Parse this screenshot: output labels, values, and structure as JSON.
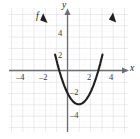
{
  "figure": {
    "kind": "cartesian-graph",
    "background": "#ffffff",
    "grid_color": "#d9d9de",
    "axis_color": "#6d6e71",
    "curve_color": "#231f20",
    "tick_text_color": "#3a3a3c"
  },
  "axes": {
    "x_axis_label": "x",
    "y_axis_label": "y",
    "x_ticks": [
      {
        "label": "–4",
        "value": -4
      },
      {
        "label": "–2",
        "value": -2
      },
      {
        "label": "2",
        "value": 2
      },
      {
        "label": "4",
        "value": 4
      }
    ],
    "y_ticks": [
      {
        "label": "4",
        "value": 4
      },
      {
        "label": "2",
        "value": 2
      },
      {
        "label": "–2",
        "value": -2
      },
      {
        "label": "–4",
        "value": -4
      }
    ],
    "xlim": [
      -5,
      5.5
    ],
    "ylim": [
      -5.5,
      5.5
    ]
  },
  "curve_label": "f",
  "chart_data": {
    "type": "line",
    "title": "",
    "xlabel": "x",
    "ylabel": "y",
    "xlim": [
      -5,
      5.5
    ],
    "ylim": [
      -5.5,
      5.5
    ],
    "grid": true,
    "legend": "none",
    "series": [
      {
        "name": "f",
        "shape": "parabola-opening-upward",
        "vertex": [
          1,
          -3
        ],
        "y_intercept": -2,
        "x_intercepts": [
          -0.73,
          2.73
        ],
        "x": [
          -1.1,
          -0.9,
          -0.7,
          -0.5,
          -0.3,
          -0.1,
          0.1,
          0.3,
          0.5,
          0.7,
          0.9,
          1.1,
          1.3,
          1.5,
          1.7,
          1.9,
          2.1,
          2.3,
          2.5,
          2.7,
          2.9,
          3.1
        ],
        "values": [
          1.41,
          0.61,
          -0.11,
          -0.75,
          -1.31,
          -1.79,
          -2.19,
          -2.51,
          -2.75,
          -2.91,
          -2.99,
          -2.99,
          -2.91,
          -2.75,
          -2.51,
          -2.19,
          -1.79,
          -1.31,
          -0.75,
          -0.11,
          0.61,
          1.41
        ],
        "arrow_ends": [
          "up-left",
          "up-right"
        ]
      }
    ],
    "annotations": [
      {
        "text": "f",
        "x": -1.5,
        "y": 4.7,
        "style": "italic"
      }
    ]
  },
  "tick_positions_px": {
    "x_minus4": {
      "left": 16,
      "top": 73
    },
    "x_minus2": {
      "left": 39,
      "top": 73
    },
    "x_2": {
      "left": 87,
      "top": 73
    },
    "x_4": {
      "left": 109,
      "top": 73
    },
    "y_4": {
      "left": 57,
      "top": 29
    },
    "y_2": {
      "left": 57,
      "top": 51
    },
    "y_m2": {
      "left": 71,
      "top": 88
    },
    "y_m4": {
      "left": 71,
      "top": 111
    }
  }
}
